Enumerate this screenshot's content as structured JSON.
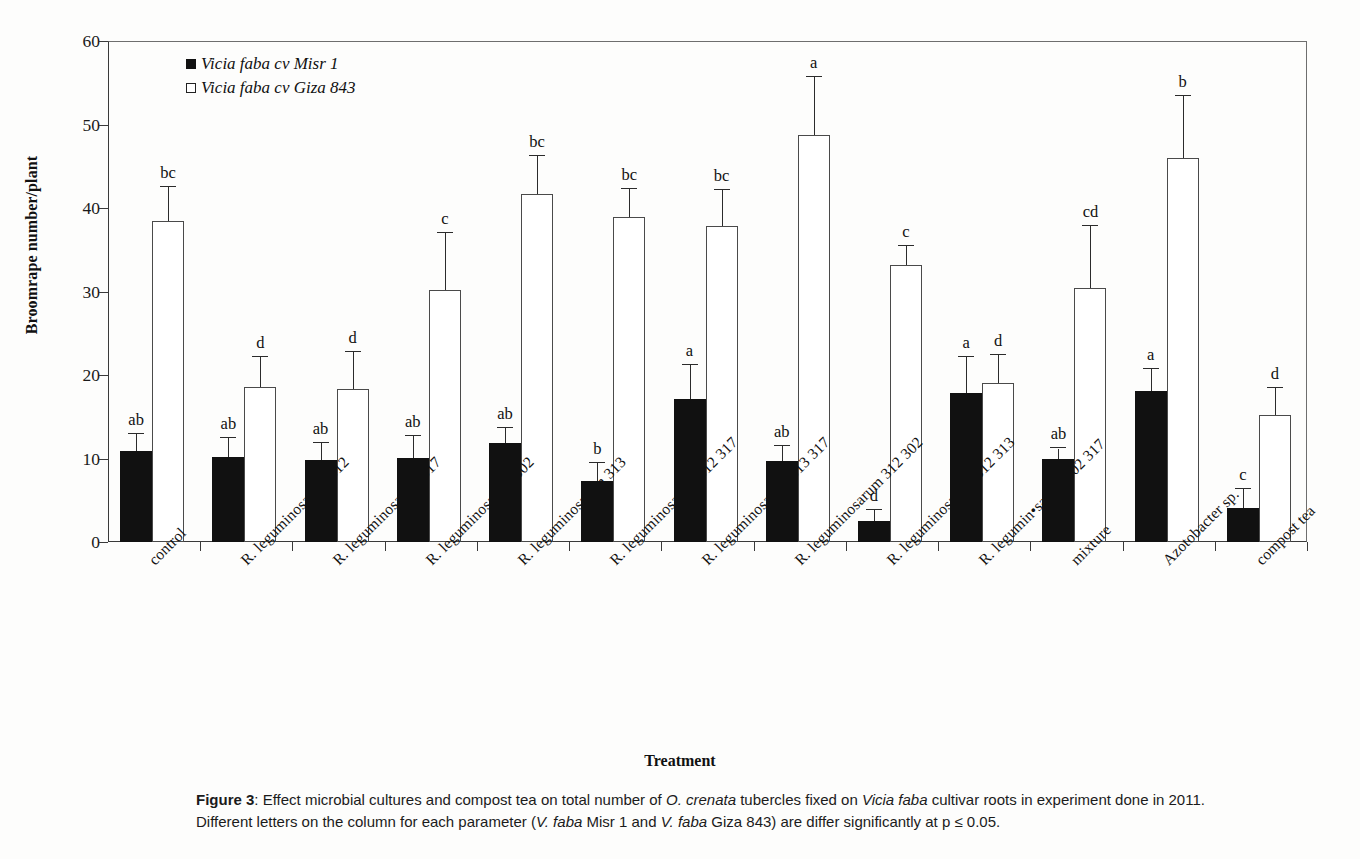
{
  "chart_data": {
    "type": "bar",
    "title": "",
    "xlabel": "Treatment",
    "ylabel": "Broomrape number/plant",
    "ylim": [
      0,
      60
    ],
    "ytick_values": [
      0,
      10,
      20,
      30,
      40,
      50,
      60
    ],
    "ytick_labels": [
      "0",
      "10",
      "20",
      "30",
      "40",
      "50",
      "60"
    ],
    "grid": false,
    "legend_position": "upper-left-inside",
    "categories": [
      "control",
      "R. leguminosarum 312",
      "R. leguminosarum 317",
      "R. leguminosarum 302",
      "R. leguminosarum 313",
      "R. leguminosarum 312 317",
      "R. leguminosarum 313 317",
      "R. leguminosarum 312 302",
      "R. leguminosarum 312 313",
      "R. legumin•sarum 302 317",
      "mixture",
      "Azotobacter sp.",
      "compost tea"
    ],
    "series": [
      {
        "name": "Vicia faba cv Misr 1",
        "color": "#111111",
        "style": "filled",
        "values": [
          10.9,
          10.2,
          9.8,
          10.1,
          11.9,
          7.3,
          17.1,
          9.7,
          2.5,
          17.9,
          9.9,
          18.1,
          4.1
        ],
        "errors": [
          2.0,
          2.2,
          2.1,
          2.6,
          1.8,
          2.2,
          4.1,
          1.8,
          1.3,
          4.2,
          1.3,
          2.6,
          2.3
        ],
        "sig_letters": [
          "ab",
          "ab",
          "ab",
          "ab",
          "ab",
          "b",
          "a",
          "ab",
          "d",
          "a",
          "ab",
          "a",
          "c"
        ]
      },
      {
        "name": "Vicia faba cv Giza 843",
        "color": "#ffffff",
        "style": "hollow",
        "values": [
          38.4,
          18.6,
          18.3,
          30.2,
          41.7,
          38.9,
          37.9,
          48.8,
          33.2,
          19.0,
          30.4,
          46.0,
          15.2
        ],
        "errors": [
          4.1,
          3.5,
          4.5,
          6.8,
          4.5,
          3.4,
          4.2,
          6.9,
          2.2,
          3.4,
          7.4,
          7.4,
          3.2
        ],
        "sig_letters": [
          "bc",
          "d",
          "d",
          "c",
          "bc",
          "bc",
          "bc",
          "a",
          "c",
          "d",
          "cd",
          "b",
          "d"
        ]
      }
    ]
  },
  "caption": {
    "figure_number": "Figure 3",
    "line1_a": ": Effect microbial cultures and compost tea on total number of ",
    "line1_italic1": "O. crenata",
    "line1_b": " tubercles fixed on ",
    "line1_italic2": "Vicia faba",
    "line1_c": " cultivar roots in experiment done in 2011.",
    "line2_a": "Different letters on the column for each parameter (",
    "line2_italic1": "V. faba",
    "line2_b": " Misr 1 and ",
    "line2_italic2": "V. faba",
    "line2_c": " Giza 843) are differ significantly at p ≤ 0.05."
  }
}
